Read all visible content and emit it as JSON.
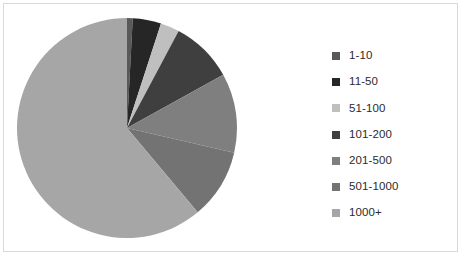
{
  "chart_data": {
    "type": "pie",
    "title": "",
    "legend_position": "right",
    "categories": [
      "1-10",
      "11-50",
      "51-100",
      "101-200",
      "201-500",
      "501-1000",
      "1000+"
    ],
    "values": [
      0.8,
      4.2,
      2.8,
      9.2,
      11.7,
      10.3,
      61.0
    ],
    "angles_deg": [
      3,
      15,
      10,
      33,
      42,
      37,
      220
    ],
    "colors": [
      "#595959",
      "#262626",
      "#bfbfbf",
      "#3f3f3f",
      "#7f7f7f",
      "#737373",
      "#a6a6a6"
    ],
    "start_angle_deg": 0,
    "direction": "clockwise",
    "labels_shown": false,
    "grid": false
  },
  "legend": {
    "items": [
      {
        "label": "1-10",
        "color": "#595959"
      },
      {
        "label": "11-50",
        "color": "#262626"
      },
      {
        "label": "51-100",
        "color": "#bfbfbf"
      },
      {
        "label": "101-200",
        "color": "#3f3f3f"
      },
      {
        "label": "201-500",
        "color": "#7f7f7f"
      },
      {
        "label": "501-1000",
        "color": "#737373"
      },
      {
        "label": "1000+",
        "color": "#a6a6a6"
      }
    ]
  },
  "frame": {
    "border_color": "#d9d9d9",
    "background": "#ffffff"
  }
}
